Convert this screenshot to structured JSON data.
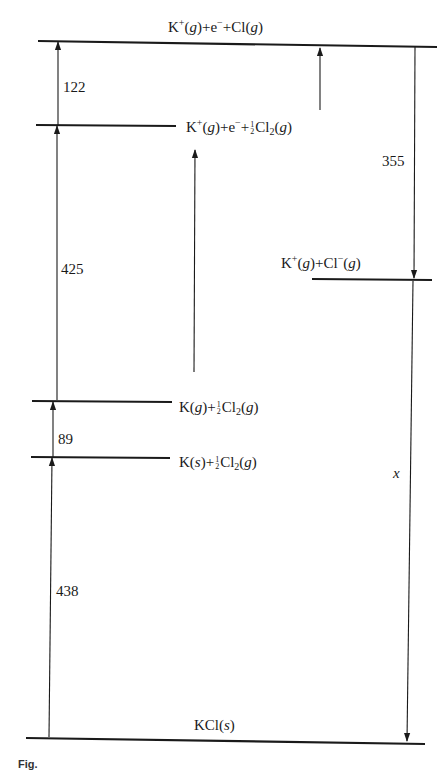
{
  "diagram": {
    "type": "Born-Haber cycle (energy level diagram)",
    "levels": [
      {
        "id": "top",
        "species": [
          "K",
          "+",
          "(g)",
          "+e",
          "−",
          "+Cl(g)"
        ],
        "label": "K⁺(g)+e⁻+Cl(g)"
      },
      {
        "id": "ionized_half_cl2",
        "label": "K⁺(g)+e⁻+½Cl₂(g)"
      },
      {
        "id": "ion_pair",
        "label": "K⁺(g)+Cl⁻(g)"
      },
      {
        "id": "k_gas",
        "label": "K(g)+½Cl₂(g)"
      },
      {
        "id": "k_solid",
        "label": "K(s)+½Cl₂(g)"
      },
      {
        "id": "kcl_solid",
        "label": "KCl(s)"
      }
    ],
    "values": {
      "atomization_cl": "122",
      "ionization_k": "425",
      "sublimation_k": "89",
      "formation_kcl": "438",
      "electron_affinity_cl": "355",
      "lattice_energy": "x"
    }
  },
  "labels": {
    "top": {
      "a": "K",
      "sup1": "+",
      "b": "(",
      "g1": "g",
      "c": ")+e",
      "sup2": "−",
      "d": "+Cl(",
      "g2": "g",
      "e": ")"
    },
    "ionized": {
      "a": "K",
      "sup1": "+",
      "b": "(",
      "g1": "g",
      "c": ")+e",
      "sup2": "−",
      "d": "+",
      "num": "1",
      "den": "2",
      "e": "Cl",
      "sub": "2",
      "f": "(",
      "g2": "g",
      "h": ")"
    },
    "ion_pair": {
      "a": "K",
      "sup1": "+",
      "b": "(",
      "g1": "g",
      "c": ")+Cl",
      "sup2": "−",
      "d": "(",
      "g2": "g",
      "e": ")"
    },
    "k_gas": {
      "a": "K(",
      "g1": "g",
      "b": ")+",
      "num": "1",
      "den": "2",
      "c": "Cl",
      "sub": "2",
      "d": "(",
      "g2": "g",
      "e": ")"
    },
    "k_solid": {
      "a": "K(",
      "s": "s",
      "b": ")+",
      "num": "1",
      "den": "2",
      "c": "Cl",
      "sub": "2",
      "d": "(",
      "g2": "g",
      "e": ")"
    },
    "kcl": {
      "a": "KCl(",
      "s": "s",
      "b": ")"
    }
  },
  "caption": "Fig."
}
